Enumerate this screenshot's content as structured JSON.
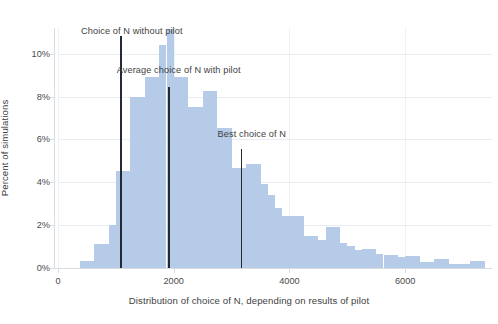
{
  "chart_data": {
    "type": "bar",
    "title": "",
    "subtitle": "",
    "xlabel": "Distribution of choice of N, depending on results of pilot",
    "ylabel": "Percent of simulations",
    "xlim": [
      0,
      7500
    ],
    "ylim": [
      0,
      11.2
    ],
    "grid": true,
    "legend_position": "none",
    "xticks": [
      0,
      2000,
      4000,
      6000
    ],
    "xtick_labels": [
      "0",
      "2000",
      "4000",
      "6000"
    ],
    "yticks": [
      0,
      2,
      4,
      6,
      8,
      10
    ],
    "ytick_labels": [
      "0%",
      "2%",
      "4%",
      "6%",
      "8%",
      "10%"
    ],
    "bin_width": 125,
    "bin_starts": [
      375,
      500,
      625,
      750,
      875,
      1000,
      1125,
      1250,
      1375,
      1500,
      1625,
      1750,
      1875,
      2000,
      2125,
      2250,
      2375,
      2500,
      2625,
      2750,
      2875,
      3000,
      3125,
      3250,
      3375,
      3500,
      3625,
      3750,
      3875,
      4000,
      4125,
      4250,
      4375,
      4500,
      4625,
      4750,
      4875,
      5000,
      5125,
      5250,
      5375,
      5500,
      5625,
      5750,
      5875,
      6000,
      6125,
      6250,
      6375,
      6500,
      6625,
      6750,
      6875,
      7000,
      7125,
      7250
    ],
    "values": [
      0.35,
      0.35,
      1.1,
      1.1,
      2.0,
      4.55,
      4.55,
      8.0,
      8.0,
      8.9,
      8.9,
      10.4,
      11.15,
      8.9,
      8.9,
      7.5,
      7.5,
      8.25,
      8.25,
      6.55,
      6.55,
      4.65,
      4.65,
      4.85,
      4.85,
      3.9,
      3.4,
      2.8,
      2.45,
      2.45,
      2.45,
      1.5,
      1.5,
      1.3,
      1.9,
      1.9,
      1.15,
      1.05,
      0.85,
      0.9,
      0.9,
      0.65,
      0.6,
      0.6,
      0.5,
      0.55,
      0.55,
      0.3,
      0.3,
      0.4,
      0.4,
      0.2,
      0.2,
      0.2,
      0.35,
      0.35
    ],
    "bar_color": "#b6cbe8",
    "gridline_color": "#e9ecf1",
    "marker_color": "#232a33",
    "markers": [
      {
        "label": "Choice of N without pilot",
        "x": 1080,
        "label_x": 1275,
        "label_y_pct": 11.05,
        "line_top_pct": 10.85
      },
      {
        "label": "Average choice of N with pilot",
        "x": 1900,
        "label_x": 2085,
        "label_y_pct": 9.25,
        "line_top_pct": 8.45
      },
      {
        "label": "Best choice of N",
        "x": 3160,
        "label_x": 3350,
        "label_y_pct": 6.25,
        "line_top_pct": 5.55
      }
    ]
  }
}
